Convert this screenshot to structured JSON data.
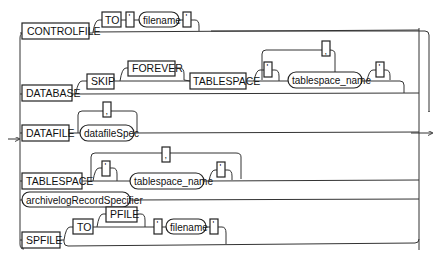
{
  "diagram": {
    "type": "railroad-syntax",
    "branches": {
      "controlfile": {
        "keyword": "CONTROLFILE",
        "to": "TO",
        "quote_open": "'",
        "filename": "filename",
        "quote_close": "'"
      },
      "database": {
        "keyword": "DATABASE",
        "skip": "SKIP",
        "forever": "FOREVER",
        "tablespace": "TABLESPACE",
        "comma": ",",
        "quote_open": "'",
        "tablespace_name": "tablespace_name",
        "quote_close": "'"
      },
      "datafile": {
        "keyword": "DATAFILE",
        "comma": ",",
        "spec": "datafileSpec"
      },
      "tablespace": {
        "keyword": "TABLESPACE",
        "comma": ",",
        "quote_open": "'",
        "tablespace_name": "tablespace_name",
        "quote_close": "'"
      },
      "archivelog": {
        "spec": "archivelogRecordSpecifier"
      },
      "spfile": {
        "keyword": "SPFILE",
        "to": "TO",
        "pfile": "PFILE",
        "quote_open": "'",
        "filename": "filename",
        "quote_close": "'"
      }
    }
  }
}
